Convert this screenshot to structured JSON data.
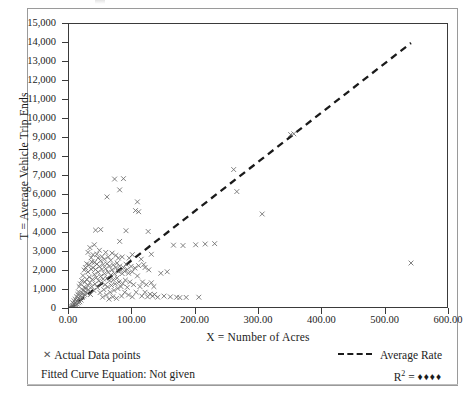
{
  "figure": {
    "background_color": "#ffffff",
    "frame_color": "#9a9a9a"
  },
  "axes": {
    "x": {
      "title": "X = Number of Acres",
      "tick_labels": [
        "0.00",
        "100.00",
        "200.00",
        "300.00",
        "400.00",
        "500.00",
        "600.00"
      ],
      "tick_values": [
        0,
        100,
        200,
        300,
        400,
        500,
        600
      ],
      "min": 0,
      "max": 600
    },
    "y": {
      "title": "T = Average Vehicle Trip Ends",
      "tick_labels": [
        "0",
        "1,000",
        "2,000",
        "3,000",
        "4,000",
        "5,000",
        "6,000",
        "7,000",
        "8,000",
        "9,000",
        "10,000",
        "11,000",
        "12,000",
        "13,000",
        "14,000",
        "15,000"
      ],
      "tick_values": [
        0,
        1000,
        2000,
        3000,
        4000,
        5000,
        6000,
        7000,
        8000,
        9000,
        10000,
        11000,
        12000,
        13000,
        14000,
        15000
      ],
      "min": 0,
      "max": 15000
    }
  },
  "legend": {
    "data_points_label": "Actual Data points",
    "data_points_marker": "x-marker-icon",
    "average_rate_label": "Average Rate",
    "average_rate_marker": "dashed-line-icon",
    "fitted_curve_label": "Fitted Curve Equation: Not given",
    "r_squared_label": "R",
    "r_squared_exponent": "2",
    "r_squared_equals": "=",
    "r_squared_value": "♦♦♦♦"
  },
  "chart_data": {
    "type": "scatter",
    "title": "",
    "xlabel": "X = Number of Acres",
    "ylabel": "T = Average Vehicle Trip Ends",
    "xlim": [
      0,
      600
    ],
    "ylim": [
      0,
      15000
    ],
    "xticks": [
      0,
      100,
      200,
      300,
      400,
      500,
      600
    ],
    "yticks": [
      0,
      1000,
      2000,
      3000,
      4000,
      5000,
      6000,
      7000,
      8000,
      9000,
      10000,
      11000,
      12000,
      13000,
      14000,
      15000
    ],
    "grid": false,
    "legend_position": "below-axes",
    "series": [
      {
        "name": "Actual Data points",
        "type": "scatter",
        "marker": "x",
        "color": "#6a6a6a",
        "points": [
          [
            3,
            60
          ],
          [
            4,
            120
          ],
          [
            5,
            40
          ],
          [
            6,
            180
          ],
          [
            6,
            330
          ],
          [
            7,
            90
          ],
          [
            8,
            250
          ],
          [
            8,
            430
          ],
          [
            9,
            150
          ],
          [
            10,
            300
          ],
          [
            10,
            520
          ],
          [
            11,
            200
          ],
          [
            12,
            410
          ],
          [
            12,
            640
          ],
          [
            13,
            260
          ],
          [
            14,
            480
          ],
          [
            14,
            760
          ],
          [
            15,
            330
          ],
          [
            15,
            900
          ],
          [
            16,
            560
          ],
          [
            16,
            1180
          ],
          [
            17,
            380
          ],
          [
            18,
            700
          ],
          [
            18,
            1320
          ],
          [
            19,
            470
          ],
          [
            20,
            850
          ],
          [
            20,
            1500
          ],
          [
            21,
            600
          ],
          [
            22,
            1000
          ],
          [
            22,
            1760
          ],
          [
            23,
            690
          ],
          [
            24,
            1150
          ],
          [
            24,
            2050
          ],
          [
            25,
            760
          ],
          [
            25,
            1420
          ],
          [
            26,
            900
          ],
          [
            26,
            2180
          ],
          [
            27,
            1080
          ],
          [
            28,
            1560
          ],
          [
            28,
            2380
          ],
          [
            29,
            820
          ],
          [
            30,
            1240
          ],
          [
            30,
            1950
          ],
          [
            30,
            2980
          ],
          [
            31,
            1010
          ],
          [
            32,
            1680
          ],
          [
            32,
            2320
          ],
          [
            33,
            1390
          ],
          [
            33,
            3230
          ],
          [
            34,
            760
          ],
          [
            35,
            2090
          ],
          [
            35,
            2700
          ],
          [
            36,
            1180
          ],
          [
            36,
            2480
          ],
          [
            37,
            1560
          ],
          [
            38,
            2180
          ],
          [
            38,
            2860
          ],
          [
            39,
            980
          ],
          [
            40,
            1820
          ],
          [
            40,
            2450
          ],
          [
            40,
            3380
          ],
          [
            41,
            1320
          ],
          [
            42,
            2080
          ],
          [
            42,
            4150
          ],
          [
            43,
            1650
          ],
          [
            44,
            2360
          ],
          [
            44,
            2880
          ],
          [
            45,
            1120
          ],
          [
            46,
            1940
          ],
          [
            46,
            2680
          ],
          [
            47,
            1480
          ],
          [
            48,
            2240
          ],
          [
            48,
            3090
          ],
          [
            49,
            860
          ],
          [
            50,
            1720
          ],
          [
            50,
            2540
          ],
          [
            50,
            4180
          ],
          [
            51,
            1360
          ],
          [
            52,
            2080
          ],
          [
            52,
            2760
          ],
          [
            53,
            620
          ],
          [
            54,
            1580
          ],
          [
            54,
            2340
          ],
          [
            55,
            1020
          ],
          [
            56,
            1860
          ],
          [
            56,
            2620
          ],
          [
            57,
            1280
          ],
          [
            58,
            2120
          ],
          [
            58,
            2980
          ],
          [
            59,
            740
          ],
          [
            60,
            1620
          ],
          [
            60,
            2380
          ],
          [
            60,
            5900
          ],
          [
            61,
            1160
          ],
          [
            62,
            1940
          ],
          [
            62,
            2740
          ],
          [
            63,
            520
          ],
          [
            64,
            1480
          ],
          [
            64,
            2260
          ],
          [
            65,
            880
          ],
          [
            66,
            1780
          ],
          [
            66,
            2560
          ],
          [
            67,
            1240
          ],
          [
            68,
            2060
          ],
          [
            68,
            2940
          ],
          [
            69,
            640
          ],
          [
            70,
            1540
          ],
          [
            70,
            2320
          ],
          [
            71,
            980
          ],
          [
            72,
            1860
          ],
          [
            72,
            6840
          ],
          [
            73,
            1320
          ],
          [
            74,
            2180
          ],
          [
            74,
            2820
          ],
          [
            75,
            560
          ],
          [
            76,
            1640
          ],
          [
            76,
            2420
          ],
          [
            77,
            1080
          ],
          [
            78,
            1980
          ],
          [
            78,
            2680
          ],
          [
            79,
            1420
          ],
          [
            80,
            2260
          ],
          [
            80,
            3560
          ],
          [
            80,
            6270
          ],
          [
            82,
            1180
          ],
          [
            82,
            2040
          ],
          [
            83,
            680
          ],
          [
            84,
            1860
          ],
          [
            84,
            2740
          ],
          [
            85,
            1340
          ],
          [
            86,
            2180
          ],
          [
            86,
            6860
          ],
          [
            88,
            880
          ],
          [
            88,
            1980
          ],
          [
            89,
            1520
          ],
          [
            90,
            2360
          ],
          [
            90,
            4120
          ],
          [
            92,
            1140
          ],
          [
            92,
            2080
          ],
          [
            94,
            740
          ],
          [
            94,
            1880
          ],
          [
            95,
            2680
          ],
          [
            96,
            1420
          ],
          [
            98,
            2240
          ],
          [
            100,
            640
          ],
          [
            100,
            1960
          ],
          [
            100,
            2860
          ],
          [
            102,
            1280
          ],
          [
            104,
            2160
          ],
          [
            105,
            5180
          ],
          [
            106,
            880
          ],
          [
            108,
            1740
          ],
          [
            108,
            5640
          ],
          [
            110,
            2280
          ],
          [
            110,
            5120
          ],
          [
            112,
            1180
          ],
          [
            114,
            2620
          ],
          [
            115,
            680
          ],
          [
            116,
            1420
          ],
          [
            118,
            2340
          ],
          [
            120,
            880
          ],
          [
            120,
            2180
          ],
          [
            122,
            1280
          ],
          [
            124,
            640
          ],
          [
            125,
            4080
          ],
          [
            126,
            2060
          ],
          [
            128,
            780
          ],
          [
            130,
            1380
          ],
          [
            130,
            2880
          ],
          [
            132,
            680
          ],
          [
            134,
            1180
          ],
          [
            135,
            760
          ],
          [
            140,
            620
          ],
          [
            145,
            1880
          ],
          [
            150,
            680
          ],
          [
            155,
            1960
          ],
          [
            160,
            640
          ],
          [
            165,
            3360
          ],
          [
            170,
            620
          ],
          [
            175,
            600
          ],
          [
            180,
            3340
          ],
          [
            185,
            610
          ],
          [
            200,
            3380
          ],
          [
            205,
            620
          ],
          [
            215,
            3420
          ],
          [
            230,
            3440
          ],
          [
            260,
            7340
          ],
          [
            265,
            6180
          ],
          [
            305,
            5000
          ],
          [
            350,
            9180
          ],
          [
            355,
            9220
          ],
          [
            540,
            2420
          ]
        ]
      },
      {
        "name": "Average Rate",
        "type": "line",
        "style": "dashed",
        "color": "#1a1a1a",
        "points": [
          [
            0,
            0
          ],
          [
            540,
            14000
          ]
        ],
        "slope": 25.93
      }
    ]
  }
}
